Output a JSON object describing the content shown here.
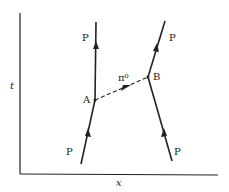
{
  "diagram": {
    "type": "feynman-spacetime",
    "axes": {
      "x_label": "x",
      "y_label": "t"
    },
    "vertices": [
      {
        "id": "A",
        "label": "A"
      },
      {
        "id": "B",
        "label": "B"
      }
    ],
    "lines": [
      {
        "id": "left-incoming",
        "particle": "P",
        "label": "P",
        "to": "A"
      },
      {
        "id": "left-outgoing",
        "particle": "P",
        "label": "P",
        "from": "A"
      },
      {
        "id": "right-incoming",
        "particle": "P",
        "label": "P",
        "to": "B"
      },
      {
        "id": "right-outgoing",
        "particle": "P",
        "label": "P",
        "from": "B"
      },
      {
        "id": "exchange",
        "particle": "pi0",
        "label": "π⁰",
        "from": "A",
        "to": "B",
        "style": "dashed"
      }
    ],
    "colors": {
      "line": "#222222",
      "background": "#ffffff"
    }
  }
}
